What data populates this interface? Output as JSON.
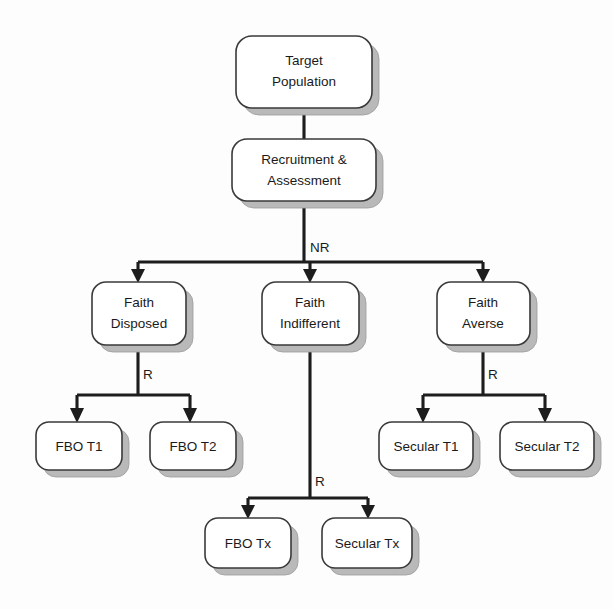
{
  "diagram": {
    "type": "flowchart",
    "title": "",
    "background_color": "#fdfdfd",
    "box_fill_color": "#ffffff",
    "box_border_color": "#3a3a3a",
    "shadow_color": "#b9b9b9",
    "line_color": "#1d1d1d",
    "text_color": "#1a1a1a",
    "nodes": [
      {
        "id": "target-population",
        "line1": "Target",
        "line2": "Population",
        "x": 236,
        "y": 36,
        "w": 136,
        "h": 72
      },
      {
        "id": "recruitment-assessment",
        "line1": "Recruitment &",
        "line2": "Assessment",
        "x": 232,
        "y": 139,
        "w": 144,
        "h": 62
      },
      {
        "id": "faith-disposed",
        "line1": "Faith",
        "line2": "Disposed",
        "x": 92,
        "y": 282,
        "w": 94,
        "h": 63
      },
      {
        "id": "faith-indifferent",
        "line1": "Faith",
        "line2": "Indifferent",
        "x": 262,
        "y": 282,
        "w": 97,
        "h": 63
      },
      {
        "id": "faith-averse",
        "line1": "Faith",
        "line2": "Averse",
        "x": 437,
        "y": 282,
        "w": 93,
        "h": 63
      },
      {
        "id": "fbo-t1",
        "line1": "FBO T1",
        "line2": "",
        "x": 36,
        "y": 422,
        "w": 86,
        "h": 48
      },
      {
        "id": "fbo-t2",
        "line1": "FBO T2",
        "line2": "",
        "x": 150,
        "y": 422,
        "w": 86,
        "h": 48
      },
      {
        "id": "secular-t1",
        "line1": "Secular T1",
        "line2": "",
        "x": 379,
        "y": 422,
        "w": 94,
        "h": 48
      },
      {
        "id": "secular-t2",
        "line1": "Secular T2",
        "line2": "",
        "x": 500,
        "y": 422,
        "w": 94,
        "h": 48
      },
      {
        "id": "fbo-tx",
        "line1": "FBO Tx",
        "line2": "",
        "x": 205,
        "y": 518,
        "w": 86,
        "h": 50
      },
      {
        "id": "secular-tx",
        "line1": "Secular Tx",
        "line2": "",
        "x": 322,
        "y": 518,
        "w": 90,
        "h": 50
      }
    ],
    "edge_labels": [
      {
        "id": "nr-label",
        "text": "NR",
        "x": 310,
        "y": 248
      },
      {
        "id": "r-label-left",
        "text": "R",
        "x": 143,
        "y": 375
      },
      {
        "id": "r-label-right",
        "text": "R",
        "x": 488,
        "y": 375
      },
      {
        "id": "r-label-center",
        "text": "R",
        "x": 315,
        "y": 482
      }
    ],
    "edges": [
      {
        "from": "target-population",
        "to": "recruitment-assessment",
        "label": ""
      },
      {
        "from": "recruitment-assessment",
        "to": "faith-disposed",
        "label": "NR"
      },
      {
        "from": "recruitment-assessment",
        "to": "faith-indifferent",
        "label": "NR"
      },
      {
        "from": "recruitment-assessment",
        "to": "faith-averse",
        "label": "NR"
      },
      {
        "from": "faith-disposed",
        "to": "fbo-t1",
        "label": "R"
      },
      {
        "from": "faith-disposed",
        "to": "fbo-t2",
        "label": "R"
      },
      {
        "from": "faith-averse",
        "to": "secular-t1",
        "label": "R"
      },
      {
        "from": "faith-averse",
        "to": "secular-t2",
        "label": "R"
      },
      {
        "from": "faith-indifferent",
        "to": "fbo-tx",
        "label": "R"
      },
      {
        "from": "faith-indifferent",
        "to": "secular-tx",
        "label": "R"
      }
    ]
  }
}
